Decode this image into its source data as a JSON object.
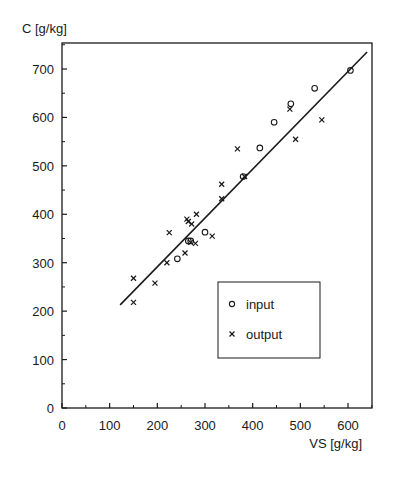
{
  "chart_data": {
    "type": "scatter",
    "title": "",
    "xlabel": "VS [g/kg]",
    "ylabel": "C [g/kg]",
    "xlim": [
      0,
      660
    ],
    "ylim": [
      0,
      754
    ],
    "x_ticks": [
      0,
      100,
      200,
      300,
      400,
      500,
      600
    ],
    "y_ticks": [
      0,
      100,
      200,
      300,
      400,
      500,
      600,
      700
    ],
    "x_minor_step": 50,
    "y_minor_step": 50,
    "grid": false,
    "legend_position": "lower right (inside plot)",
    "series": [
      {
        "name": "input",
        "marker": "circle",
        "points": [
          [
            242,
            308
          ],
          [
            265,
            345
          ],
          [
            270,
            345
          ],
          [
            300,
            363
          ],
          [
            380,
            478
          ],
          [
            415,
            537
          ],
          [
            445,
            590
          ],
          [
            480,
            628
          ],
          [
            530,
            660
          ],
          [
            605,
            697
          ]
        ]
      },
      {
        "name": "output",
        "marker": "cross",
        "points": [
          [
            150,
            268
          ],
          [
            150,
            218
          ],
          [
            195,
            258
          ],
          [
            220,
            300
          ],
          [
            225,
            362
          ],
          [
            258,
            320
          ],
          [
            262,
            390
          ],
          [
            265,
            385
          ],
          [
            272,
            380
          ],
          [
            282,
            400
          ],
          [
            270,
            342
          ],
          [
            280,
            340
          ],
          [
            315,
            355
          ],
          [
            335,
            462
          ],
          [
            335,
            432
          ],
          [
            368,
            535
          ],
          [
            383,
            478
          ],
          [
            478,
            617
          ],
          [
            490,
            555
          ],
          [
            545,
            595
          ]
        ]
      }
    ],
    "fit_line": {
      "label": "regression",
      "from": [
        122,
        213
      ],
      "to": [
        640,
        735
      ]
    }
  },
  "axes": {
    "x_title": "VS [g/kg]",
    "y_title": "C [g/kg]"
  },
  "legend": {
    "items": [
      {
        "label": "input",
        "marker": "circle"
      },
      {
        "label": "output",
        "marker": "cross"
      }
    ]
  }
}
